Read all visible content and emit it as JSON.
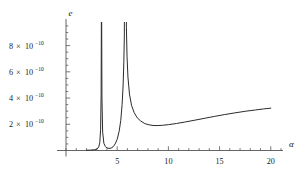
{
  "chart_data": {
    "type": "line",
    "title": "",
    "subtitle": "",
    "xlabel": "α",
    "ylabel": "e",
    "xlim": [
      0,
      21
    ],
    "ylim": [
      0,
      9.8e-10
    ],
    "grid": false,
    "legend": null,
    "x_ticks": [
      {
        "value": 5,
        "label": "5"
      },
      {
        "value": 10,
        "label": "10"
      },
      {
        "value": 15,
        "label": "15"
      },
      {
        "value": 20,
        "label": "20"
      }
    ],
    "x_minor_tick_step": 1,
    "y_ticks": [
      {
        "value": 2e-10,
        "mantissa": "2",
        "times": "×",
        "base": "10",
        "exponent": "-10",
        "label": "2 × 10^-10"
      },
      {
        "value": 4e-10,
        "mantissa": "4",
        "times": "×",
        "base": "10",
        "exponent": "-10",
        "label": "4 × 10^-10"
      },
      {
        "value": 6e-10,
        "mantissa": "6",
        "times": "×",
        "base": "10",
        "exponent": "-10",
        "label": "6 × 10^-10"
      },
      {
        "value": 8e-10,
        "mantissa": "8",
        "times": "×",
        "base": "10",
        "exponent": "-10",
        "label": "8 × 10^-10"
      }
    ],
    "y_minor_tick_step": 5e-11,
    "curve_color": "#2b2b2b",
    "axis_color": "#555555",
    "background": "#ffffff",
    "annotations": [],
    "asymptotes": [
      3.47,
      5.72,
      5.88
    ],
    "minimum": {
      "x": 8.9,
      "y": 1.9e-10
    },
    "series": [
      {
        "name": "e(α)",
        "points": [
          [
            2.0,
            2e-12
          ],
          [
            2.4,
            3e-12
          ],
          [
            2.8,
            6e-12
          ],
          [
            3.05,
            1.2e-11
          ],
          [
            3.2,
            2.8e-11
          ],
          [
            3.3,
            6e-11
          ],
          [
            3.38,
            1.6e-10
          ],
          [
            3.43,
            4.2e-10
          ],
          [
            3.455,
            9.8e-10
          ],
          [
            3.47,
            2e-09
          ],
          [
            3.485,
            9.8e-10
          ],
          [
            3.51,
            4e-10
          ],
          [
            3.58,
            1.4e-10
          ],
          [
            3.7,
            5.5e-11
          ],
          [
            3.85,
            3e-11
          ],
          [
            4.0,
            2e-11
          ],
          [
            4.2,
            1.6e-11
          ],
          [
            4.4,
            1.8e-11
          ],
          [
            4.6,
            2.8e-11
          ],
          [
            4.8,
            5e-11
          ],
          [
            5.0,
            8.5e-11
          ],
          [
            5.2,
            1.5e-10
          ],
          [
            5.35,
            2.3e-10
          ],
          [
            5.48,
            3.5e-10
          ],
          [
            5.58,
            5e-10
          ],
          [
            5.65,
            6.8e-10
          ],
          [
            5.7,
            8.8e-10
          ],
          [
            5.72,
            2e-09
          ],
          [
            5.86,
            2e-09
          ],
          [
            5.9,
            9.4e-10
          ],
          [
            5.96,
            7.2e-10
          ],
          [
            6.05,
            5.6e-10
          ],
          [
            6.2,
            4.3e-10
          ],
          [
            6.4,
            3.45e-10
          ],
          [
            6.65,
            2.9e-10
          ],
          [
            6.95,
            2.5e-10
          ],
          [
            7.3,
            2.25e-10
          ],
          [
            7.7,
            2.05e-10
          ],
          [
            8.1,
            1.96e-10
          ],
          [
            8.5,
            1.91e-10
          ],
          [
            8.9,
            1.9e-10
          ],
          [
            9.4,
            1.92e-10
          ],
          [
            10.0,
            1.97e-10
          ],
          [
            10.8,
            2.06e-10
          ],
          [
            11.6,
            2.17e-10
          ],
          [
            12.5,
            2.3e-10
          ],
          [
            13.5,
            2.45e-10
          ],
          [
            14.5,
            2.6e-10
          ],
          [
            15.5,
            2.74e-10
          ],
          [
            16.5,
            2.87e-10
          ],
          [
            17.5,
            2.99e-10
          ],
          [
            18.5,
            3.09e-10
          ],
          [
            19.3,
            3.17e-10
          ],
          [
            20.0,
            3.23e-10
          ]
        ]
      }
    ]
  }
}
